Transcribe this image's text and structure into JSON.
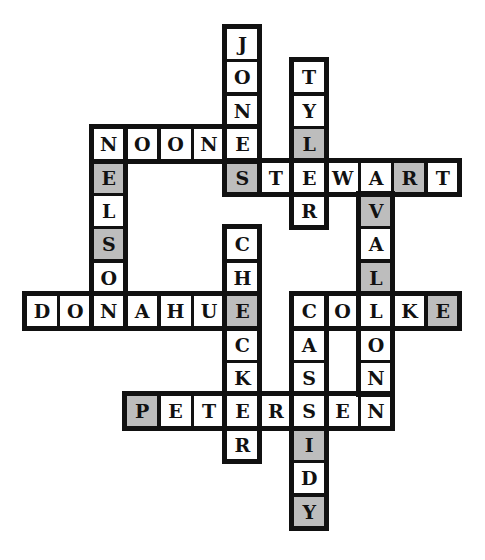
{
  "puzzle": {
    "type": "crossword-solution",
    "cell_size": 33.4,
    "origin": {
      "x": 25,
      "y": 27
    },
    "shade_color": "#bdbdbd",
    "words": [
      {
        "word": "JONES",
        "dir": "down",
        "row": 0,
        "col": 6,
        "shaded": []
      },
      {
        "word": "TYLER",
        "dir": "down",
        "row": 1,
        "col": 8,
        "shaded": [
          2
        ]
      },
      {
        "word": "NOONE",
        "dir": "across",
        "row": 3,
        "col": 2,
        "shaded": []
      },
      {
        "word": "NELSON",
        "dir": "down",
        "row": 3,
        "col": 2,
        "shaded": [
          1,
          3
        ]
      },
      {
        "word": "STEWART",
        "dir": "across",
        "row": 4,
        "col": 6,
        "shaded": [
          0,
          5
        ]
      },
      {
        "word": "VALLON",
        "dir": "down",
        "row": 5,
        "col": 10,
        "shaded": [
          0,
          2
        ]
      },
      {
        "word": "CHECKER",
        "dir": "down",
        "row": 6,
        "col": 6,
        "shaded": [
          2
        ]
      },
      {
        "word": "DONAHUE",
        "dir": "across",
        "row": 8,
        "col": 0,
        "shaded": []
      },
      {
        "word": "COOKE",
        "dir": "across",
        "row": 8,
        "col": 8,
        "shaded": [
          4
        ]
      },
      {
        "word": "CASSIDY",
        "dir": "down",
        "row": 8,
        "col": 8,
        "shaded": [
          4,
          6
        ]
      },
      {
        "word": "PETERSEN",
        "dir": "across",
        "row": 11,
        "col": 3,
        "shaded": [
          0
        ]
      }
    ]
  }
}
